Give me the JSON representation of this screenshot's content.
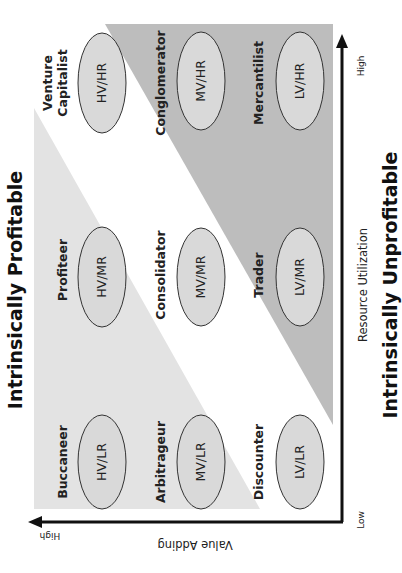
{
  "title_top": "Intrinsically Profitable",
  "title_bottom": "Intrinsically Unprofitable",
  "axes": {
    "vertical": {
      "label": "Value Adding",
      "high": "High"
    },
    "horizontal": {
      "label": "Resource Utilization",
      "low": "Low",
      "high": "High"
    }
  },
  "colors": {
    "profitable_region": "#e3e3e3",
    "unprofitable_region": "#bdbdbd",
    "ellipse_fill": "#d9d9d9",
    "ellipse_stroke": "#333333",
    "axis": "#111111"
  },
  "cells": [
    {
      "id": "hv-hr",
      "role": "Venture",
      "role2": "Capitalist",
      "code": "HV/HR"
    },
    {
      "id": "mv-hr",
      "role": "Conglomerator",
      "code": "MV/HR"
    },
    {
      "id": "lv-hr",
      "role": "Mercantilist",
      "code": "LV/HR"
    },
    {
      "id": "hv-mr",
      "role": "Profiteer",
      "code": "HV/MR"
    },
    {
      "id": "mv-mr",
      "role": "Consolidator",
      "code": "MV/MR"
    },
    {
      "id": "lv-mr",
      "role": "Trader",
      "code": "LV/MR"
    },
    {
      "id": "hv-lr",
      "role": "Buccaneer",
      "code": "HV/LR"
    },
    {
      "id": "mv-lr",
      "role": "Arbitrageur",
      "code": "MV/LR"
    },
    {
      "id": "lv-lr",
      "role": "Discounter",
      "code": "LV/LR"
    }
  ]
}
